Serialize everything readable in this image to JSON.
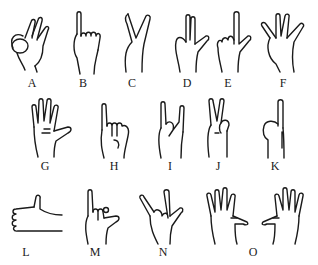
{
  "figure": {
    "gestures": [
      {
        "label": "A",
        "shape": "ok-sign"
      },
      {
        "label": "B",
        "shape": "thumb-up-fist"
      },
      {
        "label": "C",
        "shape": "v-sign-closed"
      },
      {
        "label": "D",
        "shape": "two-fingers-thumb-out"
      },
      {
        "label": "E",
        "shape": "index-thumb-out"
      },
      {
        "label": "F",
        "shape": "three-fingers-spread"
      },
      {
        "label": "G",
        "shape": "open-palm"
      },
      {
        "label": "H",
        "shape": "pinky-up-fist"
      },
      {
        "label": "I",
        "shape": "horns"
      },
      {
        "label": "J",
        "shape": "v-sign"
      },
      {
        "label": "K",
        "shape": "index-up"
      },
      {
        "label": "L",
        "shape": "thumbs-up-side"
      },
      {
        "label": "M",
        "shape": "pinky-thumb-out"
      },
      {
        "label": "N",
        "shape": "horns-thumb-out"
      },
      {
        "label": "O",
        "shape": "two-open-palms"
      }
    ]
  }
}
